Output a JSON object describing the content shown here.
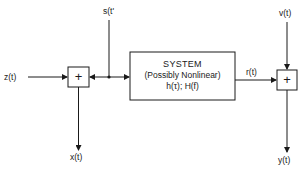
{
  "diagram": {
    "type": "block-diagram",
    "signals": {
      "input_z": "z(t)",
      "input_s": "s(t'",
      "output_r": "r(t)",
      "noise_v": "v(t)",
      "output_x": "x(t)",
      "output_y": "y(t)"
    },
    "summers": [
      {
        "id": "summer-left",
        "symbol": "+"
      },
      {
        "id": "summer-right",
        "symbol": "+"
      }
    ],
    "system": {
      "title": "SYSTEM",
      "subtitle": "(Possibly Nonlinear)",
      "functions": "h(τ); H(f)"
    },
    "colors": {
      "line": "#1a1a1a",
      "background": "#ffffff"
    }
  }
}
